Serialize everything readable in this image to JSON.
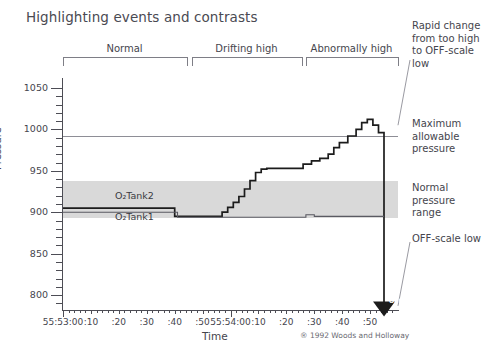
{
  "title": "Highlighting events and contrasts",
  "chart_data": {
    "type": "line",
    "title": "Highlighting events and contrasts",
    "xlabel": "Time",
    "ylabel": "Pressure",
    "ylim": [
      780,
      1060
    ],
    "yticks": [
      800,
      850,
      900,
      950,
      1000,
      1050
    ],
    "ytick_labels": [
      "800",
      "850",
      "900",
      "950",
      "1000",
      "1050"
    ],
    "grid": false,
    "legend": "inline-annotations",
    "xlim_labels": [
      "55:53:00",
      ":10",
      ":20",
      ":30",
      ":40",
      ":50",
      "55:54:00",
      ":10",
      ":20",
      ":30",
      ":40",
      ":50"
    ],
    "xticks": [
      "55:53:00",
      ":10",
      ":20",
      ":30",
      ":40",
      ":50",
      "55:54:00",
      ":10",
      ":20",
      ":30",
      ":40",
      ":50"
    ],
    "reference_lines": [
      {
        "name": "Maximum allowable pressure",
        "value": 975
      },
      {
        "name": "Normal pressure range upper",
        "value": 920
      },
      {
        "name": "Normal pressure range lower",
        "value": 885
      }
    ],
    "bands": [
      {
        "name": "Normal pressure range",
        "from": 885,
        "to": 920,
        "color": "#d2d2d2"
      }
    ],
    "series": [
      {
        "name": "O2Tank2",
        "label": "O₂Tank2",
        "style": "step",
        "color": "#1c1c1c",
        "points": [
          {
            "t": "55:53:00",
            "v": 905
          },
          {
            "t": "55:53:38",
            "v": 905
          },
          {
            "t": "55:53:40",
            "v": 895
          },
          {
            "t": "55:53:55",
            "v": 895
          },
          {
            "t": "55:53:57",
            "v": 900
          },
          {
            "t": "55:53:59",
            "v": 906
          },
          {
            "t": "55:54:01",
            "v": 912
          },
          {
            "t": "55:54:03",
            "v": 919
          },
          {
            "t": "55:54:05",
            "v": 928
          },
          {
            "t": "55:54:07",
            "v": 938
          },
          {
            "t": "55:54:09",
            "v": 948
          },
          {
            "t": "55:54:11",
            "v": 952
          },
          {
            "t": "55:54:13",
            "v": 953
          },
          {
            "t": "55:54:24",
            "v": 953
          },
          {
            "t": "55:54:26",
            "v": 958
          },
          {
            "t": "55:54:29",
            "v": 962
          },
          {
            "t": "55:54:32",
            "v": 965
          },
          {
            "t": "55:54:35",
            "v": 970
          },
          {
            "t": "55:54:37",
            "v": 978
          },
          {
            "t": "55:54:39",
            "v": 984
          },
          {
            "t": "55:54:42",
            "v": 992
          },
          {
            "t": "55:54:45",
            "v": 1000
          },
          {
            "t": "55:54:47",
            "v": 1008
          },
          {
            "t": "55:54:49",
            "v": 1012
          },
          {
            "t": "55:54:51",
            "v": 1005
          },
          {
            "t": "55:54:53",
            "v": 996
          },
          {
            "t": "55:54:54",
            "v": 996
          },
          {
            "t": "55:54:55",
            "v": 785
          }
        ]
      },
      {
        "name": "O2Tank1",
        "label": "O₂Tank1",
        "style": "step",
        "color": "#5a5a62",
        "points": [
          {
            "t": "55:53:00",
            "v": 900
          },
          {
            "t": "55:53:39",
            "v": 900
          },
          {
            "t": "55:53:41",
            "v": 894
          },
          {
            "t": "55:54:25",
            "v": 894
          },
          {
            "t": "55:54:27",
            "v": 897
          },
          {
            "t": "55:54:30",
            "v": 895
          },
          {
            "t": "55:54:55",
            "v": 895
          }
        ]
      }
    ],
    "annotations": [
      {
        "name": "off-marker",
        "text": "OFF",
        "at": "55:54:55",
        "value": 785
      }
    ]
  },
  "phase_brackets": [
    {
      "label": "Normal"
    },
    {
      "label": "Drifting high"
    },
    {
      "label": "Abnormally high"
    }
  ],
  "right_annotations": [
    {
      "name": "rapid-change",
      "text": "Rapid change from too high to OFF-scale low"
    },
    {
      "name": "max-allowable",
      "text": "Maximum allowable pressure"
    },
    {
      "name": "normal-range",
      "text": "Normal pressure range"
    },
    {
      "name": "off-scale-low",
      "text": "OFF-scale low"
    }
  ],
  "series_labels": {
    "tank2": "O₂Tank2",
    "tank1": "O₂Tank1"
  },
  "axis": {
    "ylabel": "Pressure",
    "xlabel": "Time",
    "yticks": [
      "1050",
      "1000",
      "950",
      "900",
      "850",
      "800"
    ],
    "xticks": [
      "55:53:00",
      ":10",
      ":20",
      ":30",
      ":40",
      ":50",
      "55:54:00",
      ":10",
      ":20",
      ":30",
      ":40",
      ":50"
    ]
  },
  "copyright": "® 1992 Woods and Holloway"
}
